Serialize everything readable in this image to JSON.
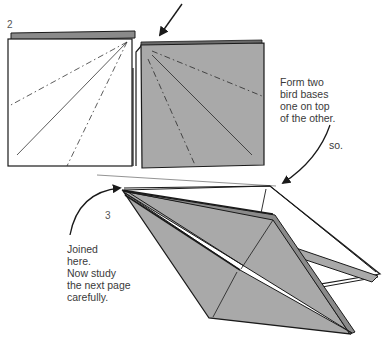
{
  "steps": [
    {
      "number": "2",
      "caption_lines": [
        "Form two",
        "bird bases",
        "one on top",
        "of the other."
      ],
      "aside": "so."
    },
    {
      "number": "3",
      "caption_lines": [
        "Joined",
        "here.",
        "Now study",
        "the next page",
        "carefully."
      ]
    }
  ],
  "colors": {
    "paper_gray": "#a9a9a9",
    "line": "#1a1a1a",
    "text": "#3a3a3a",
    "background": "#ffffff"
  }
}
